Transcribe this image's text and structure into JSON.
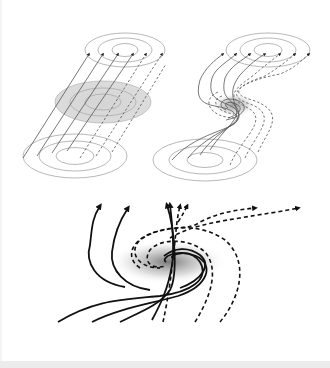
{
  "figure": {
    "panels": [
      {
        "id": "untwisted-flux-tube",
        "position": "top-left",
        "field_lines_solid": 4,
        "field_lines_dashed": 2,
        "rings": 3,
        "shaded_cross_section": true
      },
      {
        "id": "twisted-flux-tube",
        "position": "top-right",
        "field_lines_solid": 4,
        "field_lines_dashed": 3,
        "rings": 3,
        "twist_center_shaded": true
      },
      {
        "id": "vortex-field-lines",
        "position": "bottom",
        "field_lines_solid": 5,
        "field_lines_dashed": 5,
        "shaded_core": true
      }
    ],
    "colors": {
      "background": "#ffffff",
      "ring_stroke": "#b0b0b0",
      "thin_line": "#555555",
      "bold_line": "#111111",
      "shading": "#d8d8d8",
      "bottom_strip": "#ececec"
    }
  }
}
